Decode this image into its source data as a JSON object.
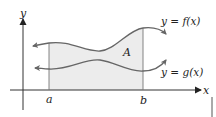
{
  "figure": {
    "axes": {
      "x_label": "x",
      "y_label": "y"
    },
    "bounds": {
      "left_label": "a",
      "right_label": "b"
    },
    "region_label": "A",
    "curves": [
      {
        "name": "upper",
        "label": "y = f(x)"
      },
      {
        "name": "lower",
        "label": "y = g(x)"
      }
    ],
    "colors": {
      "shade": "#ececec",
      "curve": "#666666",
      "axis": "#333333",
      "bound_line": "#777777"
    }
  }
}
